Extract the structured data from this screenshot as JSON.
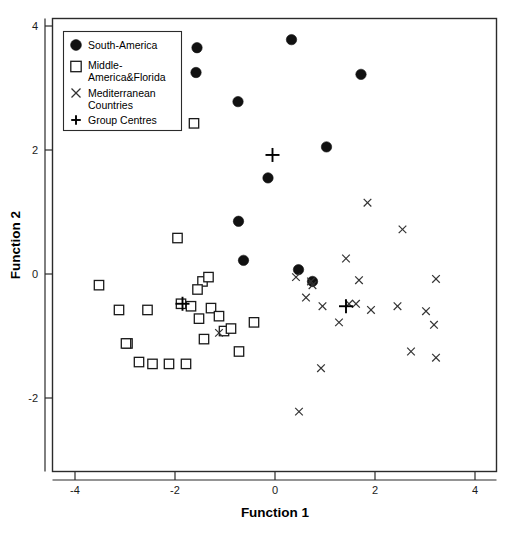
{
  "chart_data": {
    "type": "scatter",
    "title": "",
    "xlabel": "Function 1",
    "ylabel": "Function 2",
    "xlim": [
      -4.5,
      4.45
    ],
    "ylim": [
      -3.15,
      4.1
    ],
    "xticks": [
      -4,
      -2,
      0,
      2,
      4
    ],
    "yticks": [
      -2,
      0,
      2,
      4
    ],
    "xtick_labels": [
      "-4",
      "-2",
      "0",
      "2",
      "4"
    ],
    "ytick_labels": [
      "-2",
      "0",
      "2",
      "4"
    ],
    "grid": false,
    "legend_position": "top-left",
    "series": [
      {
        "name": "South-America",
        "marker": "filled-circle",
        "color": "#111111",
        "points": [
          [
            -1.56,
            3.65
          ],
          [
            -1.58,
            3.25
          ],
          [
            0.33,
            3.78
          ],
          [
            1.72,
            3.22
          ],
          [
            -0.74,
            2.78
          ],
          [
            1.03,
            2.05
          ],
          [
            -0.14,
            1.55
          ],
          [
            -0.73,
            0.85
          ],
          [
            -0.63,
            0.22
          ],
          [
            0.47,
            0.07
          ],
          [
            0.75,
            -0.12
          ]
        ]
      },
      {
        "name": "Middle-America&Florida",
        "marker": "open-square",
        "color": "#1a1a1a",
        "points": [
          [
            -1.62,
            2.43
          ],
          [
            -1.95,
            0.58
          ],
          [
            -3.52,
            -0.18
          ],
          [
            -3.12,
            -0.58
          ],
          [
            -1.45,
            -0.12
          ],
          [
            -1.55,
            -0.25
          ],
          [
            -1.33,
            -0.05
          ],
          [
            -2.95,
            -1.12
          ],
          [
            -2.55,
            -0.58
          ],
          [
            -1.88,
            -0.48
          ],
          [
            -1.68,
            -0.52
          ],
          [
            -1.28,
            -0.55
          ],
          [
            -1.12,
            -0.68
          ],
          [
            -1.52,
            -0.72
          ],
          [
            -0.42,
            -0.78
          ],
          [
            -2.72,
            -1.42
          ],
          [
            -2.45,
            -1.45
          ],
          [
            -2.12,
            -1.45
          ],
          [
            -1.78,
            -1.45
          ],
          [
            -1.02,
            -0.92
          ],
          [
            -0.88,
            -0.88
          ],
          [
            -0.72,
            -1.25
          ],
          [
            -1.42,
            -1.05
          ],
          [
            -2.98,
            -1.12
          ]
        ]
      },
      {
        "name": "Mediterranean Countries",
        "marker": "cross-x",
        "color": "#333333",
        "points": [
          [
            1.85,
            1.15
          ],
          [
            2.55,
            0.72
          ],
          [
            1.42,
            0.25
          ],
          [
            0.42,
            -0.05
          ],
          [
            3.22,
            -0.08
          ],
          [
            0.72,
            -0.12
          ],
          [
            0.75,
            -0.18
          ],
          [
            1.68,
            -0.1
          ],
          [
            0.62,
            -0.38
          ],
          [
            0.95,
            -0.52
          ],
          [
            1.48,
            -0.48
          ],
          [
            1.62,
            -0.48
          ],
          [
            1.92,
            -0.58
          ],
          [
            2.45,
            -0.52
          ],
          [
            3.02,
            -0.6
          ],
          [
            1.28,
            -0.78
          ],
          [
            3.18,
            -0.82
          ],
          [
            2.72,
            -1.25
          ],
          [
            3.22,
            -1.35
          ],
          [
            0.92,
            -1.52
          ],
          [
            -1.12,
            -0.95
          ],
          [
            0.48,
            -2.22
          ]
        ]
      },
      {
        "name": "Group Centres",
        "marker": "plus",
        "color": "#000000",
        "points": [
          [
            -0.05,
            1.92
          ],
          [
            -1.85,
            -0.48
          ],
          [
            1.42,
            -0.52
          ]
        ]
      }
    ]
  },
  "legend": {
    "items": [
      {
        "label": "South-America",
        "marker": "filled-circle"
      },
      {
        "label": "Middle-America&Florida",
        "marker": "open-square"
      },
      {
        "label": "Mediterranean Countries",
        "marker": "cross-x"
      },
      {
        "label": "Group Centres",
        "marker": "plus"
      }
    ],
    "line1": "South-America",
    "line2a": "Middle-",
    "line2b": "America&Florida",
    "line3a": "Mediterranean",
    "line3b": "Countries",
    "line4": "Group Centres"
  },
  "axes": {
    "x_title": "Function 1",
    "y_title": "Function 2",
    "x_ticks": [
      "-4",
      "-2",
      "0",
      "2",
      "4"
    ],
    "y_ticks": [
      "4",
      "2",
      "0",
      "-2"
    ]
  },
  "colors": {
    "frame": "#2b2b2b",
    "circle": "#111111",
    "square": "#1a1a1a",
    "cross": "#333333",
    "plus": "#000000",
    "background": "#ffffff"
  }
}
